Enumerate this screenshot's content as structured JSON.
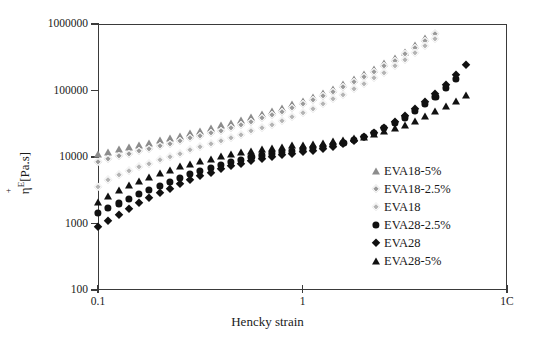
{
  "chart_data": {
    "type": "scatter",
    "title": "",
    "xlabel": "Hencky strain",
    "ylabel": "η⁺E [Pa.s]",
    "ylabel_base": "E[Pa.s]",
    "ylabel_greek": "η",
    "ylabel_plus": "+",
    "xscale": "log",
    "yscale": "log",
    "xlim": [
      0.1,
      10
    ],
    "ylim": [
      100,
      1000000
    ],
    "grid": false,
    "legend_position": "right",
    "xticks": [
      {
        "value": 0.1,
        "label": "0.1"
      },
      {
        "value": 1,
        "label": "1"
      },
      {
        "value": 10,
        "label": "1C"
      }
    ],
    "yticks": [
      {
        "value": 1000000,
        "label": "1000000"
      },
      {
        "value": 100000,
        "label": "100000"
      },
      {
        "value": 10000,
        "label": "10000"
      },
      {
        "value": 1000,
        "label": "1000"
      },
      {
        "value": 100,
        "label": "100"
      }
    ],
    "series": [
      {
        "name": "EVA18-5%",
        "marker": "triangle",
        "color": "#8c8c8c",
        "x": [
          0.1,
          0.112,
          0.126,
          0.141,
          0.158,
          0.178,
          0.2,
          0.224,
          0.251,
          0.282,
          0.316,
          0.355,
          0.398,
          0.447,
          0.501,
          0.562,
          0.631,
          0.708,
          0.794,
          0.891,
          1.0,
          1.122,
          1.259,
          1.413,
          1.585,
          1.778,
          1.995,
          2.239,
          2.512,
          2.818,
          3.162,
          3.548,
          3.981
        ],
        "y": [
          11000,
          12000,
          13000,
          14000,
          15200,
          16500,
          18000,
          19500,
          21000,
          23000,
          25000,
          27500,
          30000,
          33000,
          36000,
          40000,
          44000,
          49000,
          55000,
          62000,
          70000,
          80000,
          92000,
          107000,
          125000,
          148000,
          175000,
          210000,
          255000,
          310000,
          385000,
          480000,
          610000
        ]
      },
      {
        "name": "EVA18-2.5%",
        "marker": "diamond-shaded",
        "color": "#9a9a9a",
        "x": [
          0.1,
          0.112,
          0.126,
          0.141,
          0.158,
          0.178,
          0.2,
          0.224,
          0.251,
          0.282,
          0.316,
          0.355,
          0.398,
          0.447,
          0.501,
          0.562,
          0.631,
          0.708,
          0.794,
          0.891,
          1.0,
          1.122,
          1.259,
          1.413,
          1.585,
          1.778,
          1.995,
          2.239,
          2.512,
          2.818,
          3.162,
          3.548,
          3.981,
          4.467
        ],
        "y": [
          8500,
          9400,
          10200,
          11200,
          12200,
          13300,
          14500,
          15800,
          17300,
          19000,
          20800,
          22800,
          25000,
          27500,
          30500,
          34000,
          38000,
          42500,
          48000,
          54500,
          62000,
          71000,
          82000,
          95000,
          112000,
          132000,
          158000,
          190000,
          230000,
          282000,
          350000,
          440000,
          560000,
          700000
        ]
      },
      {
        "name": "EVA18",
        "marker": "diamond-open",
        "color": "#b4b4b4",
        "x": [
          0.1,
          0.112,
          0.126,
          0.141,
          0.158,
          0.178,
          0.2,
          0.224,
          0.251,
          0.282,
          0.316,
          0.355,
          0.398,
          0.447,
          0.501,
          0.562,
          0.631,
          0.708,
          0.794,
          0.891,
          1.0,
          1.122,
          1.259,
          1.413,
          1.585,
          1.778,
          1.995,
          2.239,
          2.512,
          2.818,
          3.162,
          3.548,
          3.981,
          4.467
        ],
        "y": [
          3600,
          4500,
          5300,
          6100,
          7000,
          7900,
          8900,
          10000,
          11200,
          12600,
          14000,
          15600,
          17400,
          19400,
          21700,
          24300,
          27300,
          30800,
          35000,
          40000,
          46000,
          53500,
          62500,
          73500,
          87000,
          104000,
          125000,
          152000,
          186000,
          230000,
          288000,
          362000,
          460000,
          590000
        ]
      },
      {
        "name": "EVA28-2.5%",
        "marker": "circle",
        "color": "#111111",
        "x": [
          0.1,
          0.112,
          0.126,
          0.141,
          0.158,
          0.178,
          0.2,
          0.224,
          0.251,
          0.282,
          0.316,
          0.355,
          0.398,
          0.447,
          0.501,
          0.562,
          0.631,
          0.708,
          0.794,
          0.891,
          1.0,
          1.122,
          1.259,
          1.413,
          1.585,
          1.778,
          1.995,
          2.239,
          2.512,
          2.818,
          3.162,
          3.548,
          3.981,
          4.467,
          5.012,
          5.623
        ],
        "y": [
          1450,
          1700,
          2000,
          2350,
          2750,
          3200,
          3700,
          4250,
          4850,
          5500,
          6200,
          6900,
          7650,
          8400,
          9150,
          9900,
          10600,
          11300,
          11900,
          12500,
          13000,
          13600,
          14300,
          15200,
          16400,
          18000,
          20200,
          23200,
          27200,
          32500,
          39500,
          49000,
          62000,
          80000,
          108000,
          150000
        ]
      },
      {
        "name": "EVA28",
        "marker": "diamond",
        "color": "#111111",
        "x": [
          0.1,
          0.112,
          0.126,
          0.141,
          0.158,
          0.178,
          0.2,
          0.224,
          0.251,
          0.282,
          0.316,
          0.355,
          0.398,
          0.447,
          0.501,
          0.562,
          0.631,
          0.708,
          0.794,
          0.891,
          1.0,
          1.122,
          1.259,
          1.413,
          1.585,
          1.778,
          1.995,
          2.239,
          2.512,
          2.818,
          3.162,
          3.548,
          3.981,
          4.467,
          5.012,
          5.623,
          6.31
        ],
        "y": [
          900,
          1100,
          1350,
          1650,
          2000,
          2400,
          2850,
          3350,
          3900,
          4500,
          5150,
          5800,
          6500,
          7200,
          7900,
          8600,
          9300,
          9950,
          10600,
          11200,
          11800,
          12500,
          13300,
          14300,
          15600,
          17400,
          19800,
          23000,
          27500,
          33500,
          41500,
          52500,
          68000,
          90000,
          122000,
          170000,
          245000
        ]
      },
      {
        "name": "EVA28-5%",
        "marker": "triangle",
        "color": "#111111",
        "x": [
          0.1,
          0.112,
          0.126,
          0.141,
          0.158,
          0.178,
          0.2,
          0.224,
          0.251,
          0.282,
          0.316,
          0.355,
          0.398,
          0.447,
          0.501,
          0.562,
          0.631,
          0.708,
          0.794,
          0.891,
          1.0,
          1.122,
          1.259,
          1.413,
          1.585,
          1.778,
          1.995,
          2.239,
          2.512,
          2.818,
          3.162,
          3.548,
          3.981,
          4.467,
          5.012,
          5.623,
          6.31
        ],
        "y": [
          2100,
          2600,
          3150,
          3750,
          4400,
          5050,
          5750,
          6450,
          7200,
          7950,
          8700,
          9450,
          10200,
          10950,
          11700,
          12400,
          13100,
          13700,
          14300,
          14900,
          15400,
          15900,
          16500,
          17200,
          18000,
          19000,
          20300,
          22000,
          24200,
          27000,
          30500,
          35000,
          41000,
          48500,
          58000,
          70000,
          86000
        ]
      }
    ]
  },
  "legend": {
    "items": [
      {
        "label": "EVA18-5%"
      },
      {
        "label": "EVA18-2.5%"
      },
      {
        "label": "EVA18"
      },
      {
        "label": "EVA28-2.5%"
      },
      {
        "label": "EVA28"
      },
      {
        "label": "EVA28-5%"
      }
    ]
  }
}
